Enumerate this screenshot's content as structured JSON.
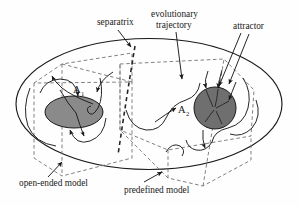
{
  "figure": {
    "background": "#fefefe",
    "ink": "#1a1a1a"
  },
  "labels": {
    "separatrix": "separatrix",
    "evolutionary_line1": "evolutionary",
    "evolutionary_line2": "trajectory",
    "attractor": "attractor",
    "open_ended_model": "open-ended model",
    "predefined_model": "predefined model"
  },
  "attractors": [
    {
      "id": "A1",
      "label": "A",
      "subscript": "1",
      "shape": "ellipse",
      "fill": "#8a8a8a",
      "stroke": "#1a1a1a",
      "cx": 74,
      "cy": 112,
      "rx": 29,
      "ry": 16
    },
    {
      "id": "A2",
      "label": "A",
      "subscript": "2",
      "shape": "circle",
      "fill": "#6f6f6f",
      "stroke": "#1a1a1a",
      "cx": 215,
      "cy": 108,
      "r": 21
    }
  ],
  "outer_boundary": {
    "name": "state-space-ellipse",
    "shape": "ellipse",
    "cx": 149,
    "cy": 104,
    "rx": 134,
    "ry": 66,
    "stroke": "#1a1a1a",
    "fill": "none"
  },
  "separatrix_line": {
    "style": "dashed-heavy",
    "stroke": "#2a2a2a",
    "dash": "4 3"
  },
  "model_regions": [
    {
      "id": "open-ended",
      "style": "dashed-light",
      "stroke": "#777777",
      "dash": "3.5 2.5"
    },
    {
      "id": "predefined",
      "style": "dashed-light",
      "stroke": "#777777",
      "dash": "3.5 2.5"
    }
  ],
  "trajectories": {
    "style": "solid-thin",
    "stroke": "#1a1a1a",
    "arrowheads": 9
  }
}
